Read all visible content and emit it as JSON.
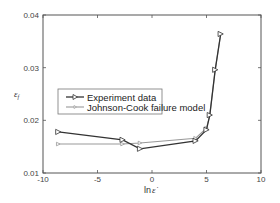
{
  "chart_data": {
    "type": "line",
    "title": "",
    "xlabel": "ln ε̇",
    "ylabel": "ε_f",
    "xlim": [
      -10,
      10
    ],
    "ylim": [
      0.01,
      0.04
    ],
    "xticks": [
      -10,
      -5,
      0,
      5,
      10
    ],
    "yticks": [
      0.01,
      0.02,
      0.03,
      0.04
    ],
    "xtick_labels": [
      "-10",
      "-5",
      "0",
      "5",
      "10"
    ],
    "ytick_labels": [
      "0.01",
      "0.02",
      "0.03",
      "0.04"
    ],
    "grid": false,
    "legend_position": "center-left",
    "series": [
      {
        "name": "Experiment data",
        "color": "#333333",
        "marker": "triangle-right-open",
        "x": [
          -8.6,
          -2.7,
          -1.1,
          4.0,
          5.0,
          5.3,
          5.8,
          6.3
        ],
        "y": [
          0.0178,
          0.0163,
          0.0146,
          0.0161,
          0.0182,
          0.021,
          0.0296,
          0.0364
        ]
      },
      {
        "name": "Johnson-Cook failure model",
        "color": "#999999",
        "marker": "triangle-right-small",
        "x": [
          -8.6,
          -2.7,
          -1.1,
          4.0,
          5.0,
          5.3,
          5.8,
          6.3
        ],
        "y": [
          0.0155,
          0.0155,
          0.0157,
          0.0166,
          0.0185,
          0.021,
          0.0296,
          0.0364
        ]
      }
    ]
  },
  "labels": {
    "x_axis_prefix": "ln",
    "x_axis_symbol": "ε̇",
    "y_axis_symbol": "ε",
    "y_axis_sub": "f",
    "legend_0": "Experiment data",
    "legend_1": "Johnson-Cook failure model"
  }
}
